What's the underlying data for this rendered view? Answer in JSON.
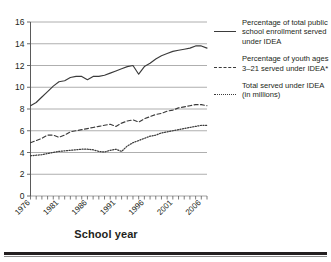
{
  "chart_data": {
    "type": "line",
    "title": "",
    "xlabel": "School year",
    "ylabel": "",
    "ylim": [
      0,
      16
    ],
    "xlim": [
      1976,
      2007
    ],
    "yticks": [
      "0",
      "2",
      "4",
      "6",
      "8",
      "10",
      "12",
      "14",
      "16"
    ],
    "xticks": [
      "1976",
      "1981",
      "1986",
      "1991",
      "1996",
      "2001",
      "2006"
    ],
    "grid": "horizontal",
    "legend_position": "right",
    "x": [
      1976,
      1977,
      1978,
      1979,
      1980,
      1981,
      1982,
      1983,
      1984,
      1985,
      1986,
      1987,
      1988,
      1989,
      1990,
      1991,
      1992,
      1993,
      1994,
      1995,
      1996,
      1997,
      1998,
      1999,
      2000,
      2001,
      2002,
      2003,
      2004,
      2005,
      2006,
      2007
    ],
    "series": [
      {
        "name": "Percentage of total public school enrollment served under IDEA",
        "style": "solid",
        "values": [
          8.3,
          8.6,
          9.1,
          9.6,
          10.1,
          10.5,
          10.6,
          10.9,
          11.0,
          11.0,
          10.7,
          11.0,
          11.0,
          11.1,
          11.3,
          11.5,
          11.7,
          11.9,
          12.0,
          11.2,
          11.9,
          12.2,
          12.6,
          12.9,
          13.1,
          13.3,
          13.4,
          13.5,
          13.6,
          13.8,
          13.8,
          13.6
        ]
      },
      {
        "name": "Percentage of youth ages 3–21 served under IDEA*",
        "style": "dashed",
        "values": [
          4.9,
          5.1,
          5.3,
          5.6,
          5.6,
          5.4,
          5.6,
          5.9,
          6.0,
          6.1,
          6.2,
          6.3,
          6.4,
          6.5,
          6.6,
          6.4,
          6.7,
          6.9,
          7.0,
          6.8,
          7.1,
          7.3,
          7.5,
          7.6,
          7.8,
          7.9,
          8.1,
          8.2,
          8.3,
          8.4,
          8.4,
          8.3
        ]
      },
      {
        "name": "Total served under IDEA (in millions)",
        "style": "dotted",
        "values": [
          3.7,
          3.75,
          3.8,
          3.9,
          4.0,
          4.1,
          4.15,
          4.2,
          4.25,
          4.3,
          4.3,
          4.25,
          4.1,
          4.05,
          4.2,
          4.3,
          4.1,
          4.6,
          4.9,
          5.1,
          5.3,
          5.5,
          5.6,
          5.8,
          5.9,
          6.0,
          6.1,
          6.2,
          6.3,
          6.4,
          6.5,
          6.5
        ]
      }
    ]
  },
  "legend": {
    "entries": [
      {
        "label": "Percentage of total public school enrollment served under IDEA",
        "style": "solid"
      },
      {
        "label": "Percentage of youth ages 3–21 served under IDEA*",
        "style": "dashed"
      },
      {
        "label": "Total served under IDEA (in millions)",
        "style": "dotted"
      }
    ]
  },
  "axes": {
    "x_title": "School year"
  }
}
